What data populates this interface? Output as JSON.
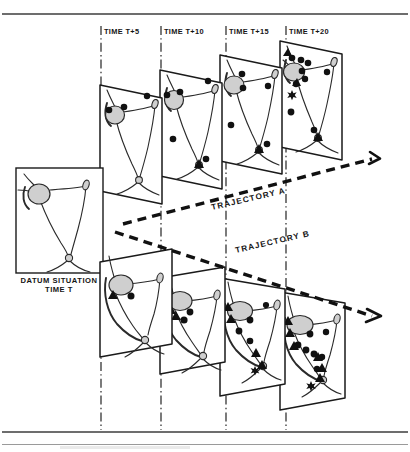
{
  "figure": {
    "kind": "scanned-line-diagram",
    "background_color": "#ffffff",
    "ink_color": "#1a1a1a",
    "blob_fill_color": "#cfcfcf",
    "marker_color": "#111111"
  },
  "page_rules": {
    "top_rule_y": 14,
    "bottom_rule_y": 432,
    "bottom_faint_rule_y": 444
  },
  "datum": {
    "label_line1": "DATUM SITUATION",
    "label_line2": "TIME T",
    "frame": {
      "x": 16,
      "y": 168,
      "width": 87,
      "height": 105
    }
  },
  "time_labels": [
    {
      "text": "TIME T+5",
      "x": 103,
      "y": 33
    },
    {
      "text": "TIME T+10",
      "x": 163,
      "y": 33
    },
    {
      "text": "TIME T+15",
      "x": 228,
      "y": 33
    },
    {
      "text": "TIME T+20",
      "x": 288,
      "y": 33
    }
  ],
  "timelines": [
    {
      "x": 101,
      "y1": 26,
      "y2": 430
    },
    {
      "x": 161,
      "y1": 26,
      "y2": 430
    },
    {
      "x": 226,
      "y1": 26,
      "y2": 430
    },
    {
      "x": 286,
      "y1": 26,
      "y2": 430
    }
  ],
  "trajectories": [
    {
      "name": "TRAJECTORY A",
      "label": "TRAJECTORY A",
      "label_x": 212,
      "label_y": 212,
      "label_rotation": -13,
      "arrow_tip_x": 382,
      "arrow_tip_y": 158
    },
    {
      "name": "TRAJECTORY B",
      "label": "TRAJECTORY B",
      "label_x": 236,
      "label_y": 252,
      "label_rotation": -13,
      "arrow_tip_x": 382,
      "arrow_tip_y": 316
    }
  ],
  "rows": [
    {
      "id": "trajectory-a-row",
      "panels": [
        {
          "time": "TIME T+5",
          "dots": 3,
          "triangles": 0,
          "stars": 0
        },
        {
          "time": "TIME T+10",
          "dots": 5,
          "triangles": 1,
          "stars": 0
        },
        {
          "time": "TIME T+15",
          "dots": 5,
          "triangles": 1,
          "stars": 0
        },
        {
          "time": "TIME T+20",
          "dots": 9,
          "triangles": 3,
          "stars": 1
        }
      ]
    },
    {
      "id": "trajectory-b-row",
      "panels": [
        {
          "time": "TIME T+5",
          "dots": 1,
          "triangles": 1,
          "stars": 0
        },
        {
          "time": "TIME T+10",
          "dots": 2,
          "triangles": 2,
          "stars": 0
        },
        {
          "time": "TIME T+15",
          "dots": 4,
          "triangles": 4,
          "stars": 1
        },
        {
          "time": "TIME T+20",
          "dots": 7,
          "triangles": 6,
          "stars": 1
        }
      ]
    }
  ]
}
